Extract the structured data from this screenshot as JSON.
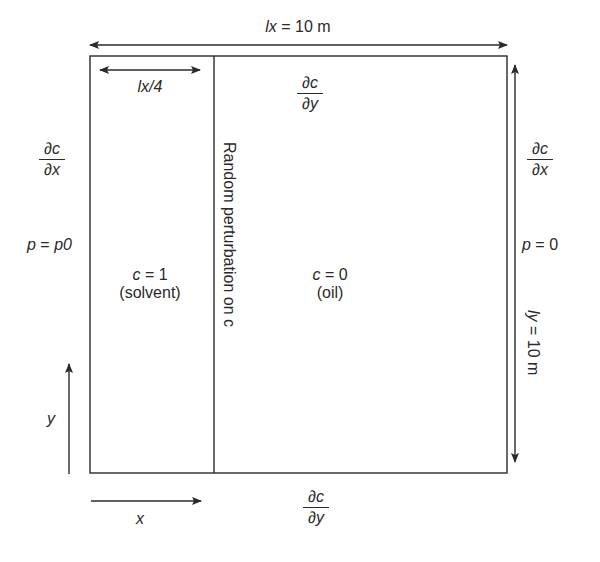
{
  "diagram": {
    "top_dimension": {
      "var": "lx",
      "eq": " = 10 m"
    },
    "solvent_width": {
      "var": "lx",
      "rest": "/4"
    },
    "right_dimension": {
      "var": "ly",
      "eq": " = 10 m"
    },
    "top_bc": {
      "num": "∂c",
      "den": "∂y"
    },
    "bottom_bc": {
      "num": "∂c",
      "den": "∂y"
    },
    "left_bc": {
      "num": "∂c",
      "den": "∂x"
    },
    "right_bc": {
      "num": "∂c",
      "den": "∂x"
    },
    "left_pressure": {
      "p": "p",
      "eq": " = ",
      "val": "p0"
    },
    "right_pressure": {
      "p": "p",
      "eq": " = 0"
    },
    "solvent_region": {
      "var": "c",
      "eq": " = 1",
      "name": "(solvent)"
    },
    "oil_region": {
      "var": "c",
      "eq": " = 0",
      "name": "(oil)"
    },
    "interface_label": "Random perturbation on c",
    "axis_x": "x",
    "axis_y": "y",
    "colors": {
      "line": "#2a2a2a",
      "background": "#ffffff"
    }
  }
}
